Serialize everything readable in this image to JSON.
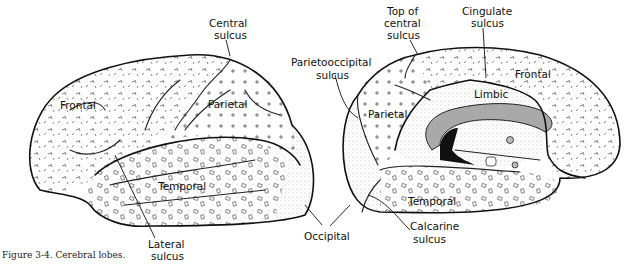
{
  "caption": "Figure 3-4. Cerebral lobes.",
  "lateral_view": {
    "labels": {
      "frontal": "Frontal",
      "parietal": "Parietal",
      "temporal": "Temporal",
      "central_sulcus_1": "Central",
      "central_sulcus_2": "sulcus",
      "lateral_sulcus_1": "Lateral",
      "lateral_sulcus_2": "sulcus"
    }
  },
  "medial_view": {
    "labels": {
      "frontal": "Frontal",
      "parietal": "Parietal",
      "temporal": "Temporal",
      "limbic": "Limbic",
      "top_central_1": "Top of",
      "top_central_2": "central",
      "top_central_3": "sulcus",
      "cingulate_1": "Cingulate",
      "cingulate_2": "sulcus",
      "parietooccipital_1": "Parietooccipital",
      "parietooccipital_2": "sulcus",
      "calcarine_1": "Calcarine",
      "calcarine_2": "sulcus"
    }
  },
  "shared_labels": {
    "occipital": "Occipital"
  },
  "colors": {
    "line": "#111111",
    "corpus_callosum": "#a9a9a9",
    "dark_region": "#111111"
  }
}
